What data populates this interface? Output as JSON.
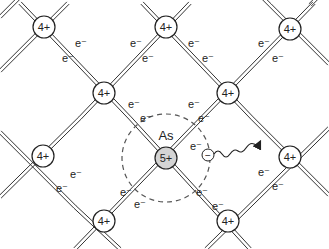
{
  "colors": {
    "bond": "#333333",
    "node_fill": "#ffffff",
    "dopant_fill": "#d4d4d4",
    "stroke": "#222222",
    "dash": "#555555"
  },
  "nodes": [
    {
      "id": "si-1",
      "x": 44,
      "y": 27,
      "label": "4+"
    },
    {
      "id": "si-2",
      "x": 166,
      "y": 27,
      "label": "4+"
    },
    {
      "id": "si-3",
      "x": 290,
      "y": 29,
      "label": "4+"
    },
    {
      "id": "si-4",
      "x": 104,
      "y": 93,
      "label": "4+"
    },
    {
      "id": "si-5",
      "x": 228,
      "y": 93,
      "label": "4+"
    },
    {
      "id": "si-6",
      "x": 43,
      "y": 156,
      "label": "4+"
    },
    {
      "id": "si-7",
      "x": 290,
      "y": 157,
      "label": "4+"
    },
    {
      "id": "si-8",
      "x": 104,
      "y": 221,
      "label": "4+"
    },
    {
      "id": "si-9",
      "x": 228,
      "y": 221,
      "label": "4+"
    }
  ],
  "dopant": {
    "x": 166,
    "y": 158,
    "label": "5+",
    "element": "As"
  },
  "electron_label": "e⁻",
  "free_electron": {
    "x": 208,
    "y": 155,
    "symbol": "−",
    "label": "e⁻"
  }
}
